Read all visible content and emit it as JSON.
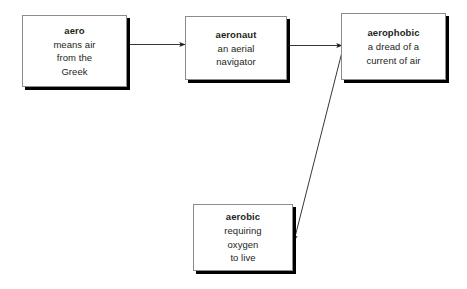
{
  "diagram": {
    "background_color": "#ffffff",
    "line_color": "#231f20",
    "box_border_color": "#8c8c8c",
    "box_shadow_color": "#000000",
    "nodes": [
      {
        "id": "aero",
        "term": "aero",
        "definition_lines": [
          "means air",
          "from the",
          "Greek"
        ]
      },
      {
        "id": "aeronaut",
        "term": "aeronaut",
        "definition_lines": [
          "an aerial",
          "navigator"
        ]
      },
      {
        "id": "aerophobic",
        "term": "aerophobic",
        "definition_lines": [
          "a dread of a",
          "current of air"
        ]
      },
      {
        "id": "aerobic",
        "term": "aerobic",
        "definition_lines": [
          "requiring",
          "oxygen",
          "to live"
        ]
      }
    ],
    "connectors": [
      {
        "id": "aero-to-aeronaut",
        "from": "aero",
        "to": "aeronaut",
        "label": ""
      },
      {
        "id": "aeronaut-to-aerophobic",
        "from": "aeronaut",
        "to": "aerophobic",
        "label": ""
      },
      {
        "id": "aerophobic-to-aerobic",
        "from": "aerophobic",
        "to": "aerobic",
        "label": ""
      }
    ]
  }
}
